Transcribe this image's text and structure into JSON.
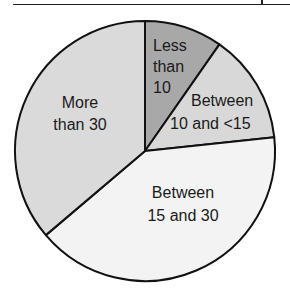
{
  "chart_data": {
    "type": "pie",
    "title": "",
    "center": [
      145,
      151
    ],
    "radius": 130,
    "start_angle_deg": 0,
    "direction": "clockwise",
    "slices": [
      {
        "label": "Less than 10",
        "label_lines": [
          "Less",
          "than",
          "10"
        ],
        "value": 9.7,
        "color": "#a8a8a8"
      },
      {
        "label": "Between 10 and <15",
        "label_lines": [
          "Between",
          "10 and <15"
        ],
        "value": 13.6,
        "color": "#d8d8d8"
      },
      {
        "label": "Between 15 and 30",
        "label_lines": [
          "Between",
          "15 and 30"
        ],
        "value": 40.5,
        "color": "#f3f3f3"
      },
      {
        "label": "More than 30",
        "label_lines": [
          "More",
          "than 30"
        ],
        "value": 36.2,
        "color": "#dadada"
      }
    ],
    "legend": "none",
    "stroke_color": "#111111"
  }
}
